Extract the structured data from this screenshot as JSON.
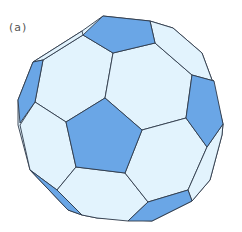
{
  "figure": {
    "panel_label": "(a)",
    "colors": {
      "pentagon": "#6aa6e6",
      "hexagon": "#e2f3fd",
      "edge": "#2f3a4a",
      "background": "#ffffff"
    },
    "faces": [
      {
        "type": "hexagon"
      },
      {
        "type": "hexagon"
      },
      {
        "type": "hexagon"
      },
      {
        "type": "hexagon"
      },
      {
        "type": "hexagon"
      },
      {
        "type": "hexagon"
      },
      {
        "type": "hexagon"
      },
      {
        "type": "hexagon"
      },
      {
        "type": "hexagon"
      },
      {
        "type": "hexagon"
      },
      {
        "type": "hexagon"
      },
      {
        "type": "hexagon"
      },
      {
        "type": "pentagon"
      },
      {
        "type": "pentagon"
      },
      {
        "type": "pentagon"
      },
      {
        "type": "pentagon"
      },
      {
        "type": "pentagon"
      },
      {
        "type": "pentagon"
      },
      {
        "type": "pentagon"
      }
    ]
  }
}
